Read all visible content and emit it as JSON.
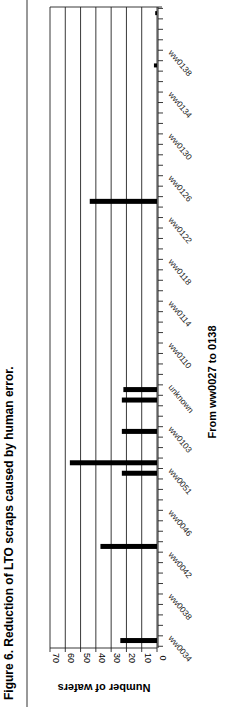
{
  "figure": {
    "caption": "Figure 6. Reduction of LTO scraps caused by human error.",
    "subtitle": "From ww0027 to 0138"
  },
  "chart_data": {
    "type": "bar",
    "orientation": "rotated 90° (vertical bars rendered sideways)",
    "title": "Figure 6. Reduction of LTO scraps caused by human error.",
    "xlabel": "From ww0027 to 0138",
    "ylabel": "Number of wafers",
    "ylim": [
      0,
      70
    ],
    "yticks": [
      0,
      10,
      20,
      30,
      40,
      50,
      60,
      70
    ],
    "grid": true,
    "tick_labels": [
      "ww0034",
      "ww0038",
      "ww0042",
      "ww0046",
      "ww0051",
      "ww0103",
      "unknown",
      "ww0110",
      "ww0114",
      "ww0118",
      "ww0122",
      "ww0126",
      "ww0130",
      "ww0134",
      "ww0138"
    ],
    "bars": [
      {
        "slot": 1,
        "label": "ww0034",
        "value": 24
      },
      {
        "slot": 10,
        "label": "ww0046",
        "value": 37
      },
      {
        "slot": 17,
        "label": "ww0051",
        "value": 23
      },
      {
        "slot": 18,
        "label": "ww0052",
        "value": 57
      },
      {
        "slot": 21,
        "label": "ww0103",
        "value": 23
      },
      {
        "slot": 24,
        "label": "unknown",
        "value": 23
      },
      {
        "slot": 25,
        "label": "unknown",
        "value": 22
      },
      {
        "slot": 43,
        "label": "ww0126",
        "value": 44
      },
      {
        "slot": 56,
        "label": "ww0134",
        "value": 2
      },
      {
        "slot": 61,
        "label": "ww0138",
        "value": 1
      }
    ],
    "categories": [
      "ww0034",
      "ww0046",
      "ww0051",
      "ww0052",
      "ww0103",
      "unknown",
      "unknown",
      "ww0126",
      "ww0134",
      "ww0138"
    ],
    "values": [
      24,
      37,
      23,
      57,
      23,
      23,
      22,
      44,
      2,
      1
    ],
    "label_slots": [
      1,
      5,
      9,
      13,
      17,
      21,
      25,
      29,
      33,
      37,
      41,
      45,
      49,
      53,
      57
    ],
    "total_slots": 61,
    "legend": null
  }
}
